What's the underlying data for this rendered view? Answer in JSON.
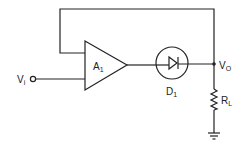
{
  "diagram": {
    "type": "circuit",
    "labels": {
      "input": "V",
      "input_sub": "i",
      "amplifier": "A",
      "amplifier_sub": "1",
      "diode": "D",
      "diode_sub": "1",
      "output": "V",
      "output_sub": "O",
      "load": "R",
      "load_sub": "L"
    },
    "components": [
      {
        "id": "A1",
        "kind": "op-amp"
      },
      {
        "id": "D1",
        "kind": "diode"
      },
      {
        "id": "RL",
        "kind": "resistor"
      },
      {
        "id": "GND",
        "kind": "ground"
      }
    ],
    "colors": {
      "line": "#222222",
      "background": "#ffffff"
    }
  }
}
